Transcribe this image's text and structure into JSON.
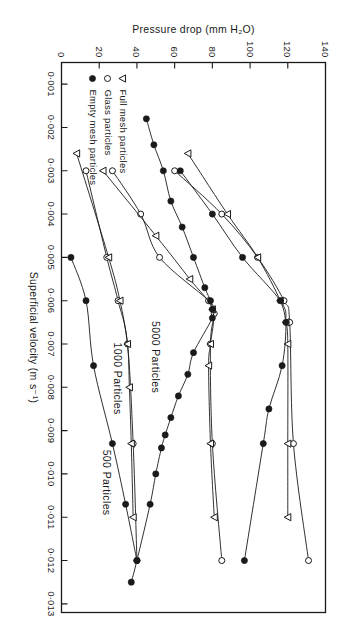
{
  "figure": {
    "rotation_deg": 90,
    "background": "#ffffff",
    "ink": "#1a1a1a"
  },
  "legend": {
    "entries": [
      {
        "marker": "open-triangle-down-marker",
        "label": "Full mesh particles"
      },
      {
        "marker": "open-circle-marker",
        "label": "Glass particles"
      },
      {
        "marker": "filled-circle-marker",
        "label": "Empty mesh particles"
      }
    ]
  },
  "annotations": [
    {
      "name": "series-group-label-5000",
      "text": "5000 Particles",
      "x": 0.0073,
      "y": 48
    },
    {
      "name": "series-group-label-1000",
      "text": "1000 Particles",
      "x": 0.0078,
      "y": 28
    },
    {
      "name": "series-group-label-500",
      "text": "500 Particles",
      "x": 0.0102,
      "y": 22
    }
  ],
  "chart_data": {
    "type": "line",
    "title": "",
    "xlabel": "Superficial velocity  (m s⁻¹)",
    "ylabel": "Pressure drop (mm H₂O)",
    "xlim": [
      0.0005,
      0.0132
    ],
    "ylim": [
      0,
      140
    ],
    "xticks": [
      0.001,
      0.002,
      0.003,
      0.004,
      0.005,
      0.006,
      0.007,
      0.008,
      0.009,
      0.01,
      0.011,
      0.012,
      0.013
    ],
    "xticklabels": [
      "0·001",
      "0·002",
      "0·003",
      "0·004",
      "0·005",
      "0·006",
      "0·007",
      "0·008",
      "0·009",
      "0·010",
      "0·011",
      "0·012",
      "0·013"
    ],
    "yticks": [
      0,
      20,
      40,
      60,
      80,
      100,
      120,
      140
    ],
    "yticklabels": [
      "0",
      "20",
      "40",
      "60",
      "80",
      "100",
      "120",
      "140"
    ],
    "grid": false,
    "legend_position": "lower-left",
    "series": [
      {
        "name": "5000 Particles — Glass particles",
        "group": "5000 Particles",
        "marker": "open-circle-marker",
        "x": [
          0.003,
          0.004,
          0.005,
          0.006,
          0.0065,
          0.0093,
          0.012
        ],
        "y": [
          60,
          85,
          104,
          118,
          121,
          123,
          131
        ]
      },
      {
        "name": "5000 Particles — Full mesh particles",
        "group": "5000 Particles",
        "marker": "open-triangle-down-marker",
        "x": [
          0.0026,
          0.004,
          0.005,
          0.006,
          0.0065,
          0.007,
          0.0093,
          0.011
        ],
        "y": [
          67,
          88,
          104,
          116,
          119,
          120,
          120,
          120
        ]
      },
      {
        "name": "5000 Particles — Empty mesh particles",
        "group": "5000 Particles",
        "marker": "filled-circle-marker",
        "x": [
          0.003,
          0.004,
          0.005,
          0.006,
          0.0065,
          0.0075,
          0.0085,
          0.0093,
          0.012
        ],
        "y": [
          63,
          80,
          96,
          116,
          119,
          117,
          110,
          107,
          97
        ]
      },
      {
        "name": "1000 Particles — Glass particles",
        "group": "1000 Particles",
        "marker": "open-circle-marker",
        "x": [
          0.003,
          0.004,
          0.005,
          0.006,
          0.0063,
          0.007,
          0.0093,
          0.012
        ],
        "y": [
          27,
          42,
          52,
          78,
          81,
          79,
          80,
          85
        ]
      },
      {
        "name": "1000 Particles — Full mesh particles",
        "group": "1000 Particles",
        "marker": "open-triangle-down-marker",
        "x": [
          0.003,
          0.0045,
          0.0055,
          0.0062,
          0.007,
          0.0075,
          0.0093,
          0.011
        ],
        "y": [
          22,
          50,
          68,
          80,
          79,
          78,
          79,
          81
        ]
      },
      {
        "name": "1000 Particles — Empty mesh particles",
        "group": "1000 Particles",
        "marker": "filled-circle-marker",
        "x": [
          0.0018,
          0.0024,
          0.003,
          0.0037,
          0.0043,
          0.005,
          0.0057,
          0.006,
          0.0062,
          0.0064,
          0.0072,
          0.0077,
          0.0082,
          0.0087,
          0.0091,
          0.0094,
          0.01,
          0.0107,
          0.012,
          0.0125
        ],
        "y": [
          45,
          49,
          54,
          58,
          64,
          70,
          76,
          79,
          80,
          80,
          70,
          67,
          62,
          58,
          55,
          53,
          50,
          47,
          40,
          37
        ]
      },
      {
        "name": "500 Particles — Glass particles",
        "group": "500 Particles",
        "marker": "open-circle-marker",
        "x": [
          0.003,
          0.005,
          0.006,
          0.007,
          0.0093,
          0.012
        ],
        "y": [
          13,
          24,
          30,
          35,
          38,
          40
        ]
      },
      {
        "name": "500 Particles — Full mesh particles",
        "group": "500 Particles",
        "marker": "open-triangle-down-marker",
        "x": [
          0.0026,
          0.005,
          0.006,
          0.007,
          0.008,
          0.0093,
          0.011
        ],
        "y": [
          8,
          25,
          31,
          35,
          36,
          37,
          38
        ]
      },
      {
        "name": "500 Particles — Empty mesh particles",
        "group": "500 Particles",
        "marker": "filled-circle-marker",
        "x": [
          0.005,
          0.006,
          0.0075,
          0.0093,
          0.0107,
          0.012
        ],
        "y": [
          5,
          13,
          17,
          27,
          34,
          40
        ]
      }
    ]
  }
}
